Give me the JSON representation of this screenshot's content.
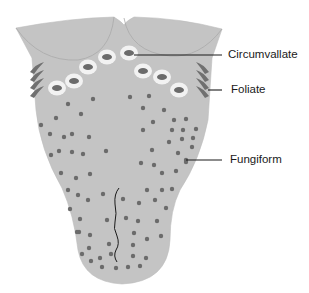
{
  "colors": {
    "tongue": "#c4c4c4",
    "tongue_edge": "#b2b2b2",
    "papilla": "#6b6b6b",
    "ring": "#f2f2f2",
    "leader": "#1a1a1a"
  },
  "labels": [
    {
      "id": "circumvallate",
      "text": "Circumvallate"
    },
    {
      "id": "foliate",
      "text": "Foliate"
    },
    {
      "id": "fungiform",
      "text": "Fungiform"
    }
  ]
}
